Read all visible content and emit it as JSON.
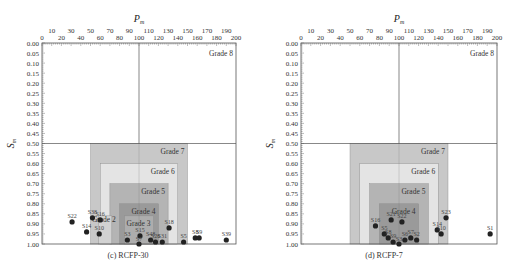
{
  "chart_data": [
    {
      "type": "scatter",
      "title": "(c) RCFP-30",
      "xlabel": "P_m",
      "ylabel": "S_m",
      "xlim": [
        0,
        200
      ],
      "ylim": [
        0,
        1.0
      ],
      "y_inverted": true,
      "x_axis_position": "top",
      "x_ticks_upper": [
        10,
        30,
        50,
        70,
        90,
        110,
        130,
        150,
        170,
        190
      ],
      "x_ticks_lower": [
        0,
        20,
        40,
        60,
        80,
        100,
        120,
        140,
        160,
        180,
        200
      ],
      "y_ticks": [
        0.0,
        0.05,
        0.1,
        0.15,
        0.2,
        0.25,
        0.3,
        0.35,
        0.4,
        0.45,
        0.5,
        0.55,
        0.6,
        0.65,
        0.7,
        0.75,
        0.8,
        0.85,
        0.9,
        0.95,
        1.0
      ],
      "reference_lines": {
        "vertical_x": 100,
        "horizontal_y": 0.5
      },
      "grades": [
        {
          "label": "Grade 8",
          "x": [
            0,
            200
          ],
          "y": [
            0,
            1.0
          ],
          "color": "#ffffff"
        },
        {
          "label": "Grade 7",
          "x": [
            50,
            150
          ],
          "y": [
            0.5,
            1.0
          ],
          "color": "#c8c8c8"
        },
        {
          "label": "Grade 6",
          "x": [
            60,
            140
          ],
          "y": [
            0.6,
            1.0
          ],
          "color": "#e4e4e4"
        },
        {
          "label": "Grade 5",
          "x": [
            70,
            130
          ],
          "y": [
            0.7,
            1.0
          ],
          "color": "#b4b4b4"
        },
        {
          "label": "Grade 4",
          "x": [
            80,
            120
          ],
          "y": [
            0.8,
            1.0
          ],
          "color": "#9a9a9a"
        },
        {
          "label": "Grade 3",
          "x": [
            85,
            115
          ],
          "y": [
            0.86,
            1.0
          ],
          "color": "#adadad"
        },
        {
          "label": "Grade 2",
          "x": [
            58,
            72
          ],
          "y": [
            0.86,
            1.0
          ],
          "color": "#d2d2d2"
        }
      ],
      "points": [
        {
          "label": "S22",
          "x": 31,
          "y": 0.89
        },
        {
          "label": "S38",
          "x": 52,
          "y": 0.87
        },
        {
          "label": "S16",
          "x": 60,
          "y": 0.88
        },
        {
          "label": "S14",
          "x": 46,
          "y": 0.94
        },
        {
          "label": "S10",
          "x": 59,
          "y": 0.95
        },
        {
          "label": "S3",
          "x": 88,
          "y": 0.98
        },
        {
          "label": "S15",
          "x": 101,
          "y": 0.96
        },
        {
          "label": "S7",
          "x": 100,
          "y": 1.0
        },
        {
          "label": "S48",
          "x": 112,
          "y": 0.98
        },
        {
          "label": "S26",
          "x": 117,
          "y": 0.99
        },
        {
          "label": "S31",
          "x": 124,
          "y": 0.99
        },
        {
          "label": "S18",
          "x": 131,
          "y": 0.92
        },
        {
          "label": "S5",
          "x": 146,
          "y": 0.99
        },
        {
          "label": "S8",
          "x": 158,
          "y": 0.97
        },
        {
          "label": "S9",
          "x": 162,
          "y": 0.97
        },
        {
          "label": "S39",
          "x": 190,
          "y": 0.98
        }
      ]
    },
    {
      "type": "scatter",
      "title": "(d) RCFP-7",
      "xlabel": "P_m",
      "ylabel": "S_m",
      "xlim": [
        0,
        200
      ],
      "ylim": [
        0,
        1.0
      ],
      "y_inverted": true,
      "x_axis_position": "top",
      "x_ticks_upper": [
        10,
        30,
        50,
        70,
        90,
        110,
        130,
        150,
        170,
        190
      ],
      "x_ticks_lower": [
        0,
        20,
        40,
        60,
        80,
        100,
        120,
        140,
        160,
        180,
        200
      ],
      "y_ticks": [
        0.0,
        0.05,
        0.1,
        0.15,
        0.2,
        0.25,
        0.3,
        0.35,
        0.4,
        0.45,
        0.5,
        0.55,
        0.6,
        0.65,
        0.7,
        0.75,
        0.8,
        0.85,
        0.9,
        0.95,
        1.0
      ],
      "reference_lines": {
        "vertical_x": 100,
        "horizontal_y": 0.5
      },
      "grades": [
        {
          "label": "Grade 8",
          "x": [
            0,
            200
          ],
          "y": [
            0,
            1.0
          ],
          "color": "#ffffff"
        },
        {
          "label": "Grade 7",
          "x": [
            50,
            150
          ],
          "y": [
            0.5,
            1.0
          ],
          "color": "#c8c8c8"
        },
        {
          "label": "Grade 6",
          "x": [
            60,
            140
          ],
          "y": [
            0.6,
            1.0
          ],
          "color": "#e4e4e4"
        },
        {
          "label": "Grade 5",
          "x": [
            70,
            130
          ],
          "y": [
            0.7,
            1.0
          ],
          "color": "#b4b4b4"
        },
        {
          "label": "Grade 4",
          "x": [
            80,
            120
          ],
          "y": [
            0.8,
            1.0
          ],
          "color": "#9a9a9a"
        }
      ],
      "points": [
        {
          "label": "S16",
          "x": 76,
          "y": 0.91
        },
        {
          "label": "S21",
          "x": 92,
          "y": 0.88
        },
        {
          "label": "S22",
          "x": 103,
          "y": 0.89
        },
        {
          "label": "S23",
          "x": 148,
          "y": 0.87
        },
        {
          "label": "S14",
          "x": 139,
          "y": 0.93
        },
        {
          "label": "S10",
          "x": 143,
          "y": 0.95
        },
        {
          "label": "S1",
          "x": 193,
          "y": 0.95
        },
        {
          "label": "S5",
          "x": 85,
          "y": 0.95
        },
        {
          "label": "S8",
          "x": 89,
          "y": 0.97
        },
        {
          "label": "S9",
          "x": 94,
          "y": 0.99
        },
        {
          "label": "S3",
          "x": 100,
          "y": 1.0
        },
        {
          "label": "S6",
          "x": 106,
          "y": 0.98
        },
        {
          "label": "S7",
          "x": 112,
          "y": 0.97
        },
        {
          "label": "S2",
          "x": 118,
          "y": 0.98
        }
      ]
    }
  ]
}
